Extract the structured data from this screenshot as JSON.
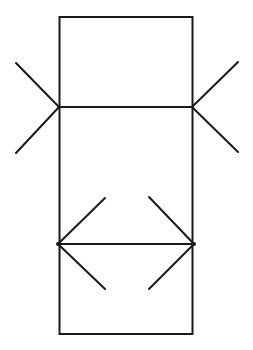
{
  "diagram": {
    "title": "",
    "colors": {
      "background": "#ffffff",
      "stroke": "#1a1a1a"
    },
    "elements": [
      {
        "name": "outer-rectangle",
        "kind": "rectangle"
      },
      {
        "name": "upper-horizontal-segment",
        "kind": "segment",
        "ends": "outward-fins"
      },
      {
        "name": "lower-horizontal-segment",
        "kind": "segment",
        "ends": "inward-arrowheads"
      }
    ],
    "labels": []
  }
}
